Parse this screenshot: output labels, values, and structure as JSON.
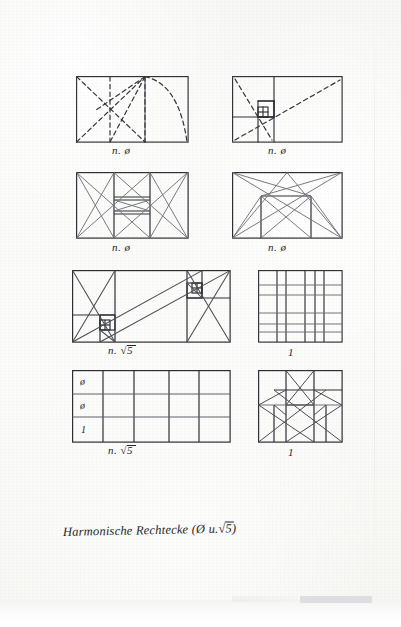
{
  "document": {
    "kind": "handwritten-drawing-sheet",
    "title": "Harmonische Rechtecke (Ø u. √5)",
    "title_parts": {
      "main": "Harmonische Rechtecke",
      "paren_open": "(",
      "phi": "Ø",
      "conjunction": "u.",
      "root": "√5",
      "paren_close": ")"
    },
    "background_color": "#fbfbfa",
    "ink_color": "#2a2c31",
    "pencil_color": "#6f7379"
  },
  "figures": [
    {
      "id": "fig-1",
      "row": 1,
      "column": "left",
      "caption": "n. ø",
      "caption_prefix": "n.",
      "caption_symbol": "ø",
      "description": "golden-ratio rectangle construction with dashed diagonals and arc",
      "line_style": "dashed",
      "x": 76,
      "y": 76,
      "w": 112,
      "h": 66
    },
    {
      "id": "fig-2",
      "row": 1,
      "column": "right",
      "caption": "n. ø",
      "caption_prefix": "n.",
      "caption_symbol": "ø",
      "description": "golden-ratio spiral of nested squares with dashed diagonals",
      "line_style": "mixed",
      "x": 232,
      "y": 76,
      "w": 110,
      "h": 66
    },
    {
      "id": "fig-3",
      "row": 2,
      "column": "left",
      "caption": "n. ø",
      "caption_prefix": "n.",
      "caption_symbol": "ø",
      "description": "rectangle divided into side squares with crossed diagonals and central band",
      "line_style": "solid",
      "x": 76,
      "y": 172,
      "w": 112,
      "h": 66
    },
    {
      "id": "fig-4",
      "row": 2,
      "column": "right",
      "caption": "n. ø",
      "caption_prefix": "n.",
      "caption_symbol": "ø",
      "description": "rectangle with inscribed rectangle and full diagonal net",
      "line_style": "solid",
      "x": 232,
      "y": 172,
      "w": 110,
      "h": 66
    },
    {
      "id": "fig-5",
      "row": 3,
      "column": "left",
      "caption": "n. √5",
      "caption_prefix": "n.",
      "caption_symbol": "√5",
      "description": "root-five rectangle with double spiral of nested squares",
      "line_style": "solid",
      "x": 72,
      "y": 270,
      "w": 158,
      "h": 72
    },
    {
      "id": "fig-6",
      "row": 3,
      "column": "right",
      "caption": "1",
      "caption_prefix": "",
      "caption_symbol": "1",
      "description": "square grid module",
      "line_style": "solid",
      "x": 258,
      "y": 270,
      "w": 84,
      "h": 72
    },
    {
      "id": "fig-7",
      "row": 4,
      "column": "left",
      "caption": "n. √5",
      "caption_prefix": "n.",
      "caption_symbol": "√5",
      "description": "root-five rectangle ruled grid with proportion labels",
      "line_style": "solid",
      "x": 72,
      "y": 370,
      "w": 158,
      "h": 72,
      "row_labels": [
        "ø",
        "ø",
        "1"
      ]
    },
    {
      "id": "fig-8",
      "row": 4,
      "column": "right",
      "caption": "1",
      "caption_prefix": "",
      "caption_symbol": "1",
      "description": "square with inscribed vertical module and diagonal star",
      "line_style": "solid",
      "x": 258,
      "y": 370,
      "w": 84,
      "h": 72
    }
  ],
  "captions": {
    "fig1": "n. ø",
    "fig2": "n. ø",
    "fig3": "n. ø",
    "fig4": "n. ø",
    "fig5_prefix": "n.",
    "fig5_root": "√5",
    "fig6": "1",
    "fig7_prefix": "n.",
    "fig7_root": "√5",
    "fig8": "1"
  },
  "row_labels_fig7": [
    "ø",
    "ø",
    "1"
  ]
}
